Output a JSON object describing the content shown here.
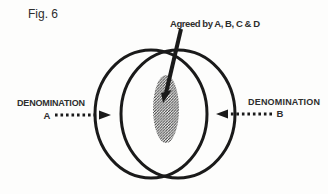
{
  "figure_label": "Fig. 6",
  "annotation": {
    "agreed_label": "Agreed by A, B, C & D"
  },
  "left_party": {
    "label": "DENOMINATION",
    "letter": "A"
  },
  "right_party": {
    "label": "DENOMINATION",
    "letter": "B"
  },
  "colors": {
    "ink": "#1a1a1a",
    "hatch": "#2a2a2a",
    "text": "#2e2e2e",
    "background": "#fdfdfc"
  }
}
